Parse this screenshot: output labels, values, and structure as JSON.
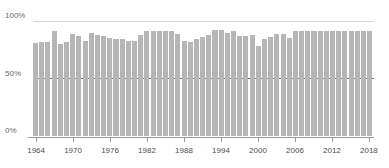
{
  "chart_data": {
    "type": "bar",
    "title": "",
    "subtitle": "",
    "xlabel": "",
    "ylabel": "",
    "ylim": [
      0,
      100
    ],
    "y_unit": "%",
    "grid": true,
    "gridlines": [
      "100%",
      "50%"
    ],
    "legend": "none",
    "axis": {
      "y_ticks": [
        "0%",
        "50%",
        "100%"
      ],
      "y_tick_values": [
        0,
        50,
        100
      ],
      "x_ticks": [
        "1964",
        "1970",
        "1976",
        "1982",
        "1988",
        "1994",
        "2000",
        "2006",
        "2012",
        "2018"
      ],
      "x_tick_values": [
        1964,
        1970,
        1976,
        1982,
        1988,
        1994,
        2000,
        2006,
        2012,
        2018
      ]
    },
    "colors": {
      "bar": "#b6b6b6",
      "gridline_light": "#d6d6d6",
      "gridline_dark": "#6e6e6e",
      "axis": "#9a9a9a",
      "label_text": "#4d4d4d",
      "ylabel_text": "#6b6b6b",
      "background": "#ffffff"
    },
    "categories": [
      "1964",
      "1965",
      "1966",
      "1967",
      "1968",
      "1969",
      "1970",
      "1971",
      "1972",
      "1973",
      "1974",
      "1975",
      "1976",
      "1977",
      "1978",
      "1979",
      "1980",
      "1981",
      "1982",
      "1983",
      "1984",
      "1985",
      "1986",
      "1987",
      "1988",
      "1989",
      "1990",
      "1991",
      "1992",
      "1993",
      "1994",
      "1995",
      "1996",
      "1997",
      "1998",
      "1999",
      "2000",
      "2001",
      "2002",
      "2003",
      "2004",
      "2005",
      "2006",
      "2007",
      "2008",
      "2009",
      "2010",
      "2011",
      "2012",
      "2013",
      "2014",
      "2015",
      "2016",
      "2017",
      "2018"
    ],
    "values": [
      81,
      82,
      82,
      91,
      80,
      82,
      89,
      87,
      83,
      90,
      88,
      87,
      85,
      84,
      84,
      83,
      83,
      88,
      91,
      91,
      91,
      91,
      91,
      89,
      83,
      82,
      84,
      86,
      88,
      92,
      92,
      90,
      91,
      87,
      87,
      88,
      78,
      84,
      86,
      89,
      89,
      85,
      91,
      91,
      91,
      91,
      91,
      91,
      91,
      91,
      91,
      91,
      91,
      91,
      91
    ]
  }
}
